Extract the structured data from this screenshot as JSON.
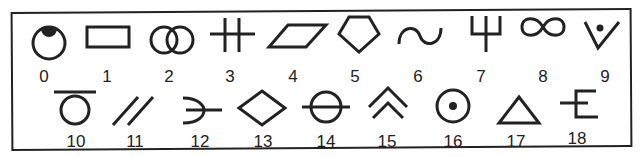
{
  "colors": {
    "ink": "#222222",
    "background": "#ffffff"
  },
  "symbols": [
    {
      "label": "0",
      "icon": "circle-with-filled-top-cap"
    },
    {
      "label": "1",
      "icon": "rectangle"
    },
    {
      "label": "2",
      "icon": "two-overlapping-circles"
    },
    {
      "label": "3",
      "icon": "double-cross"
    },
    {
      "label": "4",
      "icon": "parallelogram"
    },
    {
      "label": "5",
      "icon": "pentagon"
    },
    {
      "label": "6",
      "icon": "sine-wave"
    },
    {
      "label": "7",
      "icon": "trident"
    },
    {
      "label": "8",
      "icon": "infinity"
    },
    {
      "label": "9",
      "icon": "v-with-dot"
    },
    {
      "label": "10",
      "icon": "circle-with-bar-above"
    },
    {
      "label": "11",
      "icon": "double-slash"
    },
    {
      "label": "12",
      "icon": "open-arc-with-line"
    },
    {
      "label": "13",
      "icon": "diamond"
    },
    {
      "label": "14",
      "icon": "circle-with-horizontal-line"
    },
    {
      "label": "15",
      "icon": "double-chevron-up"
    },
    {
      "label": "16",
      "icon": "circle-with-center-dot"
    },
    {
      "label": "17",
      "icon": "triangle"
    },
    {
      "label": "18",
      "icon": "epsilon-with-line"
    }
  ]
}
